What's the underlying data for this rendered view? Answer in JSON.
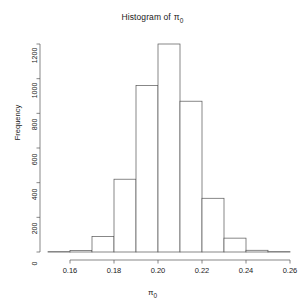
{
  "chart_data": {
    "type": "bar",
    "title_main": "Histogram of",
    "title_symbol": "π",
    "title_symbol_sub": "0",
    "xlabel": "π",
    "xlabel_sub": "0",
    "ylabel": "Frequency",
    "grid": false,
    "legend": "none",
    "bin_width": 0.01,
    "bin_edges": [
      0.15,
      0.16,
      0.17,
      0.18,
      0.19,
      0.2,
      0.21,
      0.22,
      0.23,
      0.24,
      0.25,
      0.26
    ],
    "categories": [
      "0.15-0.16",
      "0.16-0.17",
      "0.17-0.18",
      "0.18-0.19",
      "0.19-0.20",
      "0.20-0.21",
      "0.21-0.22",
      "0.22-0.23",
      "0.23-0.24",
      "0.24-0.25",
      "0.25-0.26"
    ],
    "values": [
      2,
      8,
      90,
      420,
      960,
      1200,
      870,
      310,
      80,
      10,
      2
    ],
    "xlim": [
      0.15,
      0.26
    ],
    "ylim": [
      0,
      1200
    ],
    "xticks": [
      0.16,
      0.18,
      0.2,
      0.22,
      0.24,
      0.26
    ],
    "xtick_labels": [
      "0.16",
      "0.18",
      "0.20",
      "0.22",
      "0.24",
      "0.26"
    ],
    "yticks": [
      0,
      200,
      400,
      600,
      800,
      1000,
      1200
    ],
    "ytick_labels": [
      "0",
      "200",
      "400",
      "600",
      "800",
      "1000",
      "1200"
    ],
    "bar_fill": "#ffffff",
    "bar_stroke": "#555555",
    "axis_color": "#555555"
  }
}
